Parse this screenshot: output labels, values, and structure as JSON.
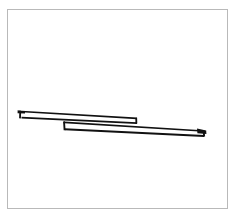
{
  "document": {
    "title": "Line drawing",
    "background_color": "#ffffff",
    "ink_color": "#111111",
    "frame_color": "#b9b9b9",
    "width": 237,
    "height": 222
  },
  "frame": {
    "name": "image-border",
    "x": 7,
    "y": 9,
    "width": 221,
    "height": 200,
    "stroke_width": 1
  },
  "artwork": {
    "subject": "two overlapping elongated planks",
    "description": "Black ink line drawing of two long slender parallelogram bars overlapping in the middle, tilted slightly downward to the right.",
    "stroke_width": 1.6,
    "shapes": [
      {
        "name": "upper-plank",
        "kind": "parallelogram-bar",
        "outline": "20,112 22,111 137,118 137,123 22,118 20,117",
        "top_edge": "22,111 137,118",
        "bottom_edge": "22,118 137,123",
        "left_cap": "20,110 20,119",
        "right_cap": "136,118 136,124"
      },
      {
        "name": "lower-plank",
        "kind": "parallelogram-bar",
        "outline": "64,122 203,131 204,136 65,129",
        "top_edge": "64,122 203,131",
        "bottom_edge": "65,129 204,136",
        "left_cap": "64,121 65,130",
        "right_cap": "202,130 204,137"
      },
      {
        "name": "left-tip-mark",
        "kind": "end-cap-wedge",
        "points": "18,110 24,111 24,114 18,114"
      },
      {
        "name": "right-tip-mark",
        "kind": "end-cap-wedge",
        "points": "198,129 206,131 206,135 198,134"
      }
    ]
  }
}
